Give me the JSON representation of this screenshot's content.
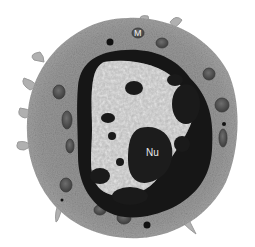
{
  "image": {
    "kind": "transmission electron micrograph",
    "subject": "cell with large nucleus",
    "palette": {
      "background": "#ffffff",
      "cytoplasm": "#9a9a9a",
      "cytoplasm_dark": "#7a7a7a",
      "heterochromatin": "#151515",
      "euchromatin": "#b5b5b5",
      "mitochondria": "#5a5a5a"
    }
  },
  "labels": {
    "mitochondrion": "M",
    "nucleolus": "Nu"
  }
}
